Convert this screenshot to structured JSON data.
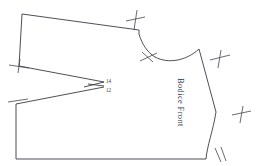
{
  "sheet": {
    "title": "Bodice Front",
    "background_color": "#ffffff",
    "line_color": "#3b3b44",
    "width": 256,
    "height": 166
  },
  "piece": {
    "label": "Bodice Front",
    "label_orientation": "vertical",
    "outline_path": "M 22 14 L 139 30 L 139 34 C 144 46 150 53 160 57 C 174 62 190 60 202 49 L 216 112 L 200 166",
    "outline_description": "Bodice front pattern piece: center front at top-left, shoulder slope, neckline curve, armhole, side seam and hem"
  },
  "labels": {
    "size_upper": "14",
    "size_lower": "12"
  },
  "notches": [
    {
      "id": "notch-shoulder-left",
      "type": "cross",
      "x": 19,
      "y": 65
    },
    {
      "id": "notch-underarm-left",
      "type": "slash",
      "x": 17,
      "y": 104
    },
    {
      "id": "notch-shoulder-top",
      "type": "cross",
      "x": 136,
      "y": 19
    },
    {
      "id": "notch-neckline",
      "type": "double-slash",
      "x": 148,
      "y": 57
    },
    {
      "id": "notch-shoulder-right",
      "type": "cross",
      "x": 219,
      "y": 58
    },
    {
      "id": "notch-side-seam",
      "type": "cross",
      "x": 241,
      "y": 113
    },
    {
      "id": "notch-hem-right",
      "type": "double-slash",
      "x": 219,
      "y": 151
    }
  ],
  "geometry": {
    "center_front_top": [
      22,
      14
    ],
    "shoulder_point": [
      139,
      30
    ],
    "neck_curve_low": [
      160,
      57
    ],
    "armhole_top": [
      202,
      49
    ],
    "side_seam_bottom": [
      216,
      112
    ],
    "hem_right": [
      206,
      159
    ],
    "hem_left": [
      16,
      159
    ],
    "underarm_left": [
      16,
      104
    ],
    "bust_point": [
      104,
      82
    ],
    "dart_apex": [
      104,
      86
    ]
  }
}
